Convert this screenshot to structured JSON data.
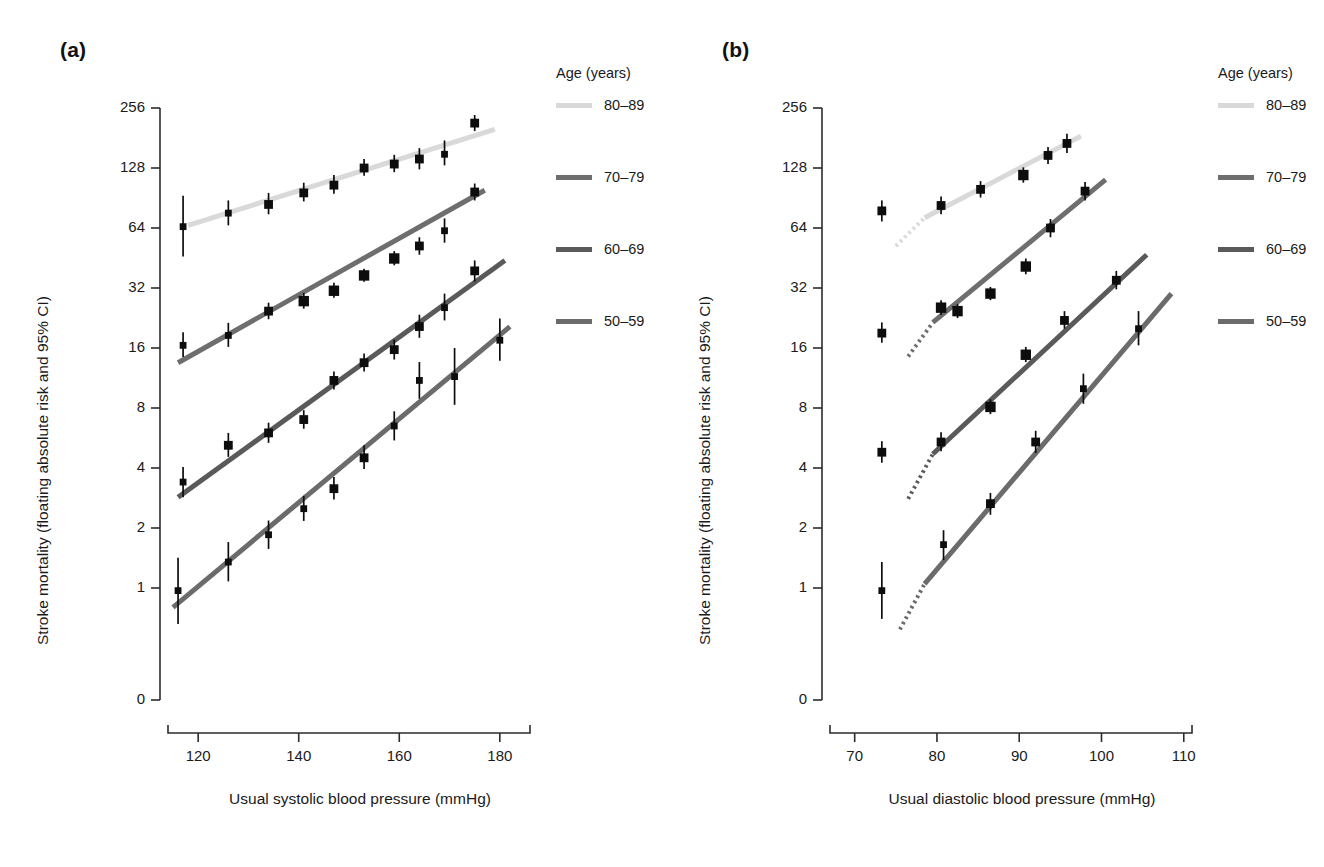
{
  "figure": {
    "panels": [
      {
        "id": "a",
        "label": "(a)",
        "xlabel": "Usual systolic blood pressure (mmHg)",
        "ylabel": "Stroke mortality (floating absolute risk and 95% CI)",
        "xticks": [
          "120",
          "140",
          "160",
          "180"
        ],
        "xtick_values": [
          120,
          140,
          160,
          180
        ],
        "yticks": [
          "256",
          "128",
          "64",
          "32",
          "16",
          "8",
          "4",
          "2",
          "1",
          "0"
        ],
        "ytick_values": [
          256,
          128,
          64,
          32,
          16,
          8,
          4,
          2,
          1,
          0
        ],
        "xlim": [
          114,
          186
        ],
        "legend": {
          "title": "Age (years)",
          "entries": [
            {
              "label": "80–89",
              "color": "#d9d9d9"
            },
            {
              "label": "70–79",
              "color": "#6e6e6e"
            },
            {
              "label": "60–69",
              "color": "#5a5a5a"
            },
            {
              "label": "50–59",
              "color": "#6b6b6b"
            }
          ]
        }
      },
      {
        "id": "b",
        "label": "(b)",
        "xlabel": "Usual diastolic blood pressure (mmHg)",
        "ylabel": "Stroke mortality (floating absolute risk and 95% CI)",
        "xticks": [
          "70",
          "80",
          "90",
          "100",
          "110"
        ],
        "xtick_values": [
          70,
          80,
          90,
          100,
          110
        ],
        "yticks": [
          "256",
          "128",
          "64",
          "32",
          "16",
          "8",
          "4",
          "2",
          "1",
          "0"
        ],
        "ytick_values": [
          256,
          128,
          64,
          32,
          16,
          8,
          4,
          2,
          1,
          0
        ],
        "xlim": [
          67,
          111
        ],
        "legend": {
          "title": "Age (years)",
          "entries": [
            {
              "label": "80–89",
              "color": "#d9d9d9"
            },
            {
              "label": "70–79",
              "color": "#6e6e6e"
            },
            {
              "label": "60–69",
              "color": "#5a5a5a"
            },
            {
              "label": "50–59",
              "color": "#6b6b6b"
            }
          ]
        }
      }
    ]
  },
  "chart_data": [
    {
      "type": "scatter",
      "panel": "a",
      "title": "",
      "xlabel": "Usual systolic blood pressure (mmHg)",
      "ylabel": "Stroke mortality (floating absolute risk and 95% CI)",
      "yscale": "log2",
      "ylim": [
        1,
        256
      ],
      "xlim": [
        114,
        186
      ],
      "grid": false,
      "legend_position": "right",
      "series": [
        {
          "name": "80–89",
          "color": "#d9d9d9",
          "x": [
            117,
            126,
            134,
            141,
            147,
            153,
            159,
            164,
            169,
            175
          ],
          "values": [
            65,
            76,
            84,
            96,
            105,
            128,
            134,
            142,
            150,
            215
          ],
          "ci_low": [
            46,
            66,
            75,
            87,
            95,
            117,
            122,
            126,
            132,
            196
          ],
          "ci_high": [
            93,
            88,
            96,
            108,
            118,
            142,
            149,
            161,
            176,
            236
          ],
          "fit_x": [
            118,
            179
          ],
          "fit_y": [
            66,
            200
          ]
        },
        {
          "name": "70–79",
          "color": "#6e6e6e",
          "x": [
            117,
            126,
            134,
            141,
            147,
            153,
            159,
            164,
            169,
            175
          ],
          "values": [
            16.5,
            18.5,
            24.5,
            27.5,
            31.0,
            37.0,
            45.0,
            52.0,
            62.0,
            97.0
          ],
          "ci_low": [
            14.4,
            16.2,
            22.3,
            25.2,
            28.6,
            34.4,
            41.6,
            47.0,
            54.0,
            88.0
          ],
          "ci_high": [
            19.2,
            21.4,
            27.0,
            30.2,
            34.0,
            40.0,
            49.0,
            57.5,
            71.5,
            107.0
          ],
          "fit_x": [
            116,
            177
          ],
          "fit_y": [
            13.5,
            99
          ]
        },
        {
          "name": "60–69",
          "color": "#5a5a5a",
          "x": [
            117,
            126,
            134,
            141,
            147,
            153,
            159,
            164,
            169,
            175
          ],
          "values": [
            3.4,
            5.2,
            6.0,
            7.0,
            11.0,
            13.5,
            15.7,
            20.5,
            25.5,
            39.0
          ],
          "ci_low": [
            2.85,
            4.55,
            5.35,
            6.3,
            9.9,
            12.2,
            14.0,
            18.0,
            22.0,
            34.5
          ],
          "ci_high": [
            4.05,
            6.0,
            6.75,
            7.8,
            12.2,
            15.0,
            17.6,
            23.5,
            30.0,
            44.0
          ],
          "fit_x": [
            116,
            181
          ],
          "fit_y": [
            2.85,
            44
          ],
          "note": "markers at 147 and 153 lie on the 60-69 line"
        },
        {
          "name": "50–59",
          "color": "#6b6b6b",
          "x": [
            116,
            126,
            134,
            141,
            147,
            153,
            159,
            164,
            171,
            180
          ],
          "values": [
            0.97,
            1.35,
            1.85,
            2.5,
            3.15,
            4.5,
            6.5,
            11.0,
            11.5,
            17.5
          ],
          "ci_low": [
            0.66,
            1.08,
            1.57,
            2.17,
            2.78,
            3.95,
            5.5,
            8.9,
            8.3,
            13.8
          ],
          "ci_high": [
            1.42,
            1.7,
            2.18,
            2.9,
            3.6,
            5.2,
            7.7,
            13.6,
            16.0,
            22.5
          ],
          "fit_x": [
            115,
            182
          ],
          "fit_y": [
            0.8,
            20.5
          ]
        }
      ]
    },
    {
      "type": "scatter",
      "panel": "b",
      "title": "",
      "xlabel": "Usual diastolic blood pressure (mmHg)",
      "ylabel": "Stroke mortality (floating absolute risk and 95% CI)",
      "yscale": "log2",
      "ylim": [
        1,
        256
      ],
      "xlim": [
        67,
        111
      ],
      "grid": false,
      "legend_position": "right",
      "series": [
        {
          "name": "80–89",
          "color": "#d9d9d9",
          "x": [
            73.3,
            80.5,
            85.3,
            90.5,
            93.5,
            95.8
          ],
          "values": [
            78,
            83,
            100,
            118,
            148,
            170
          ],
          "ci_low": [
            69,
            75,
            91,
            108,
            134,
            152
          ],
          "ci_high": [
            88,
            92,
            110,
            129,
            163,
            190
          ],
          "fit_x": [
            78.5,
            97.5
          ],
          "fit_y": [
            72,
            185
          ],
          "dotted_x": [
            75.0,
            78.5
          ],
          "dotted_y": [
            52,
            72
          ]
        },
        {
          "name": "70–79",
          "color": "#6e6e6e",
          "x": [
            73.3,
            80.5,
            82.5,
            86.5,
            90.8,
            93.8,
            98.0
          ],
          "values": [
            19.0,
            25.5,
            24.5,
            30.0,
            41.0,
            64.0,
            98.0
          ],
          "ci_low": [
            17.0,
            23.4,
            22.6,
            27.8,
            37.5,
            57.5,
            88.0
          ],
          "ci_high": [
            21.5,
            27.8,
            26.6,
            32.4,
            45.0,
            71.0,
            109.0
          ],
          "fit_x": [
            79.5,
            100.5
          ],
          "fit_y": [
            21.5,
            112
          ],
          "dotted_x": [
            76.5,
            79.5
          ],
          "dotted_y": [
            14.5,
            21.5
          ]
        },
        {
          "name": "60–69",
          "color": "#5a5a5a",
          "x": [
            73.3,
            80.5,
            86.5,
            90.8,
            95.5,
            101.8
          ],
          "values": [
            4.8,
            5.4,
            8.1,
            14.8,
            22.0,
            35.0
          ],
          "ci_low": [
            4.25,
            4.85,
            7.45,
            13.6,
            20.0,
            31.5
          ],
          "ci_high": [
            5.45,
            6.05,
            8.85,
            16.2,
            24.5,
            39.0
          ],
          "fit_x": [
            79.5,
            105.5
          ],
          "fit_y": [
            4.7,
            47
          ],
          "dotted_x": [
            76.5,
            79.5
          ],
          "dotted_y": [
            2.8,
            4.7
          ]
        },
        {
          "name": "50–59",
          "color": "#6b6b6b",
          "x": [
            73.3,
            80.8,
            86.5,
            92.0,
            97.8,
            104.5
          ],
          "values": [
            0.97,
            1.65,
            2.65,
            5.4,
            10.0,
            20.0
          ],
          "ci_low": [
            0.7,
            1.38,
            2.33,
            4.75,
            8.4,
            16.5
          ],
          "ci_high": [
            1.35,
            1.95,
            3.0,
            6.15,
            11.9,
            24.5
          ],
          "fit_x": [
            78.5,
            108.5
          ],
          "fit_y": [
            1.05,
            30.0
          ],
          "dotted_x": [
            75.5,
            78.5
          ],
          "dotted_y": [
            0.62,
            1.05
          ]
        }
      ]
    }
  ]
}
